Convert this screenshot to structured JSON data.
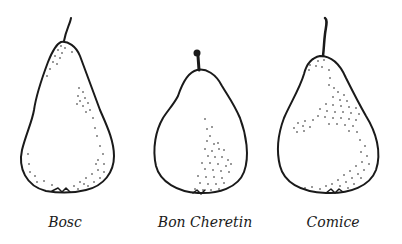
{
  "figure": {
    "pears": [
      {
        "name": "Bosc",
        "label_x": 65
      },
      {
        "name": "Bon Cheretin",
        "label_x": 205
      },
      {
        "name": "Comice",
        "label_x": 333
      }
    ]
  },
  "colors": {
    "ink": "#1a1a1a",
    "background": "#ffffff"
  }
}
